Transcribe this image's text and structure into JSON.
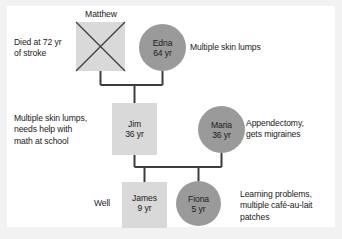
{
  "figure": {
    "type": "pedigree-chart",
    "title": "",
    "colors": {
      "male_square_fill": "#d9d9d9",
      "female_circle_fill": "#9a9a9a",
      "line": "#3c3c3c",
      "text": "#1a1a1a",
      "page_background": "#ffffff",
      "frame_background": "#f2f2f2"
    }
  },
  "generation1": {
    "matthew": {
      "top_name": "Matthew",
      "shape": "square",
      "deceased": true,
      "annotation_line1": "Died at 72 yr",
      "annotation_line2": "of stroke"
    },
    "edna": {
      "name": "Edna",
      "age": "64 yr",
      "shape": "circle",
      "affected": true,
      "annotation": "Multiple skin lumps"
    }
  },
  "generation2": {
    "jim": {
      "name": "Jim",
      "age": "36 yr",
      "shape": "square",
      "annotation_line1": "Multiple skin lumps,",
      "annotation_line2": "needs help with",
      "annotation_line3": "math at school"
    },
    "maria": {
      "name": "Maria",
      "age": "36 yr",
      "shape": "circle",
      "affected": true,
      "annotation_line1": "Appendectomy,",
      "annotation_line2": "gets migraines"
    }
  },
  "generation3": {
    "james": {
      "name": "James",
      "age": "9 yr",
      "shape": "square",
      "annotation": "Well"
    },
    "fiona": {
      "name": "Fiona",
      "age": "5 yr",
      "shape": "circle",
      "affected": true,
      "annotation_line1": "Learning problems,",
      "annotation_line2": "multiple café-au-lait",
      "annotation_line3": "patches"
    }
  }
}
